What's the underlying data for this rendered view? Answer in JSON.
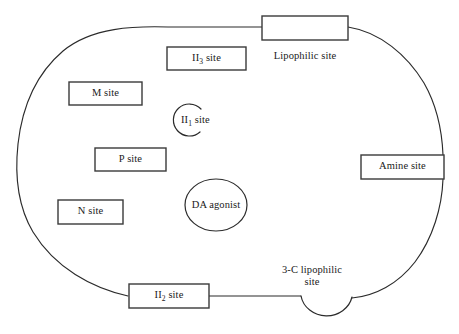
{
  "diagram": {
    "background_color": "#ffffff",
    "line_color": "#2b2b2b",
    "box_fill": "#ffffff",
    "canvas": {
      "width": 459,
      "height": 334
    }
  },
  "boxes": [
    {
      "id": "lipophilic",
      "label": "",
      "external_label": "Lipophilic site",
      "x": 262,
      "y": 16,
      "w": 86,
      "h": 24
    },
    {
      "id": "ii3",
      "label_html": "II<sub>3</sub> site",
      "label_text": "II3 site",
      "x": 167,
      "y": 47,
      "w": 79,
      "h": 23
    },
    {
      "id": "m",
      "label_html": "M site",
      "label_text": "M site",
      "x": 69,
      "y": 82,
      "w": 73,
      "h": 23
    },
    {
      "id": "p",
      "label_html": "P site",
      "label_text": "P site",
      "x": 95,
      "y": 148,
      "w": 71,
      "h": 23
    },
    {
      "id": "n",
      "label_html": "N site",
      "label_text": "N site",
      "x": 58,
      "y": 200,
      "w": 65,
      "h": 24
    },
    {
      "id": "amine",
      "label_html": "Amine site",
      "label_text": "Amine site",
      "x": 361,
      "y": 155,
      "w": 83,
      "h": 24
    },
    {
      "id": "ii2",
      "label_html": "II<sub>2</sub> site",
      "label_text": "II2 site",
      "x": 129,
      "y": 284,
      "w": 80,
      "h": 24
    }
  ],
  "circles": [
    {
      "id": "ii1",
      "label_html": "II<sub>1</sub> site",
      "label_text": "II1 site",
      "shape": "open-arc",
      "cx": 188,
      "cy": 120,
      "r": 16
    },
    {
      "id": "da-agonist",
      "label_html": "DA agonist",
      "label_text": "DA agonist",
      "shape": "closed-ellipse",
      "cx": 216,
      "cy": 205,
      "rx": 31,
      "ry": 26
    }
  ],
  "free_labels": [
    {
      "id": "lipophilic-site-label",
      "text": "Lipophilic site",
      "x": 265,
      "y": 56
    },
    {
      "id": "three-c-lipophilic-label",
      "line1": "3-C lipophilic",
      "line2": "site",
      "x": 277,
      "y": 270
    }
  ],
  "connectors": [
    {
      "id": "ii2-to-notch",
      "from": "ii2-box-right",
      "to": "3c-notch-left",
      "x1": 209,
      "y1": 296,
      "x2": 301,
      "y2": 296
    }
  ],
  "icon_names": {
    "lipophilic_box": "lipophilic-site-box",
    "notch": "semicircular-notch-shape",
    "open_arc": "open-arc-shape"
  }
}
